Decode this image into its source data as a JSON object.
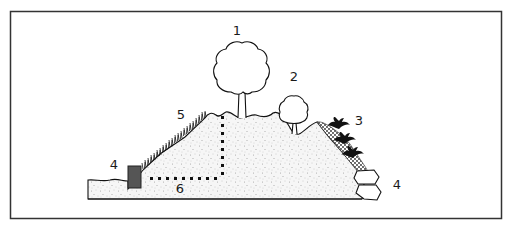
{
  "diagram": {
    "labels": [
      {
        "id": "1",
        "text": "1",
        "target": "large tree on hilltop",
        "x": 237,
        "y": 35
      },
      {
        "id": "2",
        "text": "2",
        "target": "small tree in hollow",
        "x": 294,
        "y": 81
      },
      {
        "id": "3",
        "text": "3",
        "target": "shrubs on gravel layer",
        "x": 359,
        "y": 125
      },
      {
        "id": "4a",
        "text": "4",
        "target": "retaining block at slope toe (left)",
        "x": 114,
        "y": 169
      },
      {
        "id": "4b",
        "text": "4",
        "target": "stacked boulders at slope toe (right)",
        "x": 397,
        "y": 189
      },
      {
        "id": "5",
        "text": "5",
        "target": "grass/vegetation on left slope",
        "x": 181,
        "y": 119
      },
      {
        "id": "6",
        "text": "6",
        "target": "dotted line indicating depth/measurement",
        "x": 180,
        "y": 193
      }
    ],
    "colors": {
      "frame": "#333333",
      "outline": "#111111",
      "soil_fill": "#f4f4f4",
      "soil_speckle": "#9a9a9a",
      "block": "#555555",
      "gravel": "#333333",
      "dotted_line": "#111111"
    }
  }
}
